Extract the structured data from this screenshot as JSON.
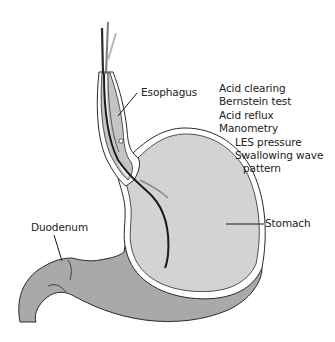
{
  "diagram": {
    "type": "anatomical illustration",
    "colors": {
      "stomach_fill": "#d3d3d3",
      "outer_wall_fill": "#a9a9a9",
      "outline": "#2a2a2a",
      "catheter": "#1a1a1a",
      "text": "#222222"
    }
  },
  "labels": {
    "esophagus": "Esophagus",
    "duodenum": "Duodenum",
    "stomach": "Stomach"
  },
  "tests": [
    {
      "label": "Acid clearing",
      "level": 0
    },
    {
      "label": "Bernstein test",
      "level": 0
    },
    {
      "label": "Acid reflux",
      "level": 0
    },
    {
      "label": "Manometry",
      "level": 0
    },
    {
      "label": "LES pressure",
      "level": 1
    },
    {
      "label": "Swallowing wave",
      "level": 1
    },
    {
      "label": "pattern",
      "level": 2
    }
  ]
}
